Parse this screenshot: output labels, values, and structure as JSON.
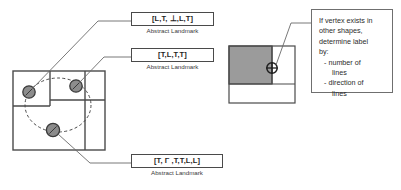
{
  "figure": {
    "stroke_color": "#4a4a4a",
    "fill_gray": "#9b9b9b",
    "vertex_gray": "#8c8c8c",
    "background": "#ffffff"
  },
  "labels": [
    {
      "id": "label-top",
      "code": "[L,T, ⊥,L,T]",
      "caption": "Abstract Landmark"
    },
    {
      "id": "label-middle",
      "code": "[T,L,T,T]",
      "caption": "Abstract Landmark"
    },
    {
      "id": "label-bottom",
      "code": "[T, Γ ,T,T,L,L]",
      "caption": "Abstract Landmark"
    }
  ],
  "note": {
    "lines": [
      "If vertex exists in",
      "other shapes,",
      "determine label",
      "by:",
      "- number of",
      "lines",
      "- direction of",
      "lines"
    ]
  },
  "left_diagram": {
    "name": "composite-shape-with-vertices",
    "vertices": [
      {
        "id": "vertex-upper-left",
        "label_ref": "label-top"
      },
      {
        "id": "vertex-upper-right",
        "label_ref": "label-middle"
      },
      {
        "id": "vertex-lower-center",
        "label_ref": "label-bottom"
      }
    ]
  },
  "right_diagram": {
    "name": "overlapping-shape-example",
    "vertices": [
      {
        "id": "vertex-shared-corner",
        "label_ref": "note"
      }
    ]
  }
}
